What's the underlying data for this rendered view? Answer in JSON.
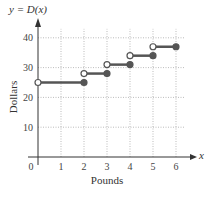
{
  "chart_data": {
    "type": "line",
    "subtype": "step",
    "title": "y = D(x)",
    "xlabel": "Pounds",
    "ylabel": "Dollars",
    "x_axis_symbol": "x",
    "xlim": [
      0,
      6
    ],
    "ylim": [
      0,
      40
    ],
    "xticks": [
      "0",
      "1",
      "2",
      "3",
      "4",
      "5",
      "6"
    ],
    "yticks": [
      "10",
      "20",
      "30",
      "40"
    ],
    "grid": true,
    "segments": [
      {
        "x_start": 0,
        "x_end": 2,
        "y": 25,
        "start": "open",
        "end": "closed"
      },
      {
        "x_start": 2,
        "x_end": 3,
        "y": 28,
        "start": "open",
        "end": "closed"
      },
      {
        "x_start": 3,
        "x_end": 4,
        "y": 31,
        "start": "open",
        "end": "closed"
      },
      {
        "x_start": 4,
        "x_end": 5,
        "y": 34,
        "start": "open",
        "end": "closed"
      },
      {
        "x_start": 5,
        "x_end": 6,
        "y": 37,
        "start": "open",
        "end": "closed"
      }
    ],
    "colors": {
      "line": "#555555",
      "grid": "#aaaaaa",
      "axis": "#333333"
    }
  }
}
